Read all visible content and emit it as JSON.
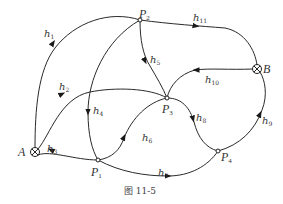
{
  "figure": {
    "caption": "图 11-5",
    "nodes": [
      {
        "id": "A",
        "label": "A",
        "sub": "",
        "type": "source-sink",
        "x": 35,
        "y": 152
      },
      {
        "id": "B",
        "label": "B",
        "sub": "",
        "type": "source-sink",
        "x": 257,
        "y": 69
      },
      {
        "id": "P1",
        "label": "P",
        "sub": "1",
        "type": "junction",
        "x": 98,
        "y": 160
      },
      {
        "id": "P2",
        "label": "P",
        "sub": "2",
        "type": "junction",
        "x": 140,
        "y": 20
      },
      {
        "id": "P3",
        "label": "P",
        "sub": "3",
        "type": "junction",
        "x": 167,
        "y": 98
      },
      {
        "id": "P4",
        "label": "P",
        "sub": "4",
        "type": "junction",
        "x": 218,
        "y": 151
      }
    ],
    "edges": [
      {
        "id": "h1",
        "label": "h",
        "sub": "1",
        "from": "A",
        "to": "P2"
      },
      {
        "id": "h2",
        "label": "h",
        "sub": "2",
        "from": "A",
        "to": "P3"
      },
      {
        "id": "h3",
        "label": "h",
        "sub": "3",
        "from": "P1",
        "to": "A"
      },
      {
        "id": "h4",
        "label": "h",
        "sub": "4",
        "from": "P2",
        "to": "P1"
      },
      {
        "id": "h5",
        "label": "h",
        "sub": "5",
        "from": "P2",
        "to": "P3"
      },
      {
        "id": "h6",
        "label": "h",
        "sub": "6",
        "from": "P1",
        "to": "P3"
      },
      {
        "id": "h7",
        "label": "h",
        "sub": "7",
        "from": "P1",
        "to": "P4"
      },
      {
        "id": "h8",
        "label": "h",
        "sub": "8",
        "from": "P3",
        "to": "P4"
      },
      {
        "id": "h9",
        "label": "h",
        "sub": "9",
        "from": "P4",
        "to": "B"
      },
      {
        "id": "h10",
        "label": "h",
        "sub": "10",
        "from": "B",
        "to": "P3"
      },
      {
        "id": "h11",
        "label": "h",
        "sub": "11",
        "from": "P2",
        "to": "B"
      }
    ],
    "colors": {
      "stroke": "#2a2a2a",
      "text": "#333333",
      "background": "#ffffff"
    }
  }
}
